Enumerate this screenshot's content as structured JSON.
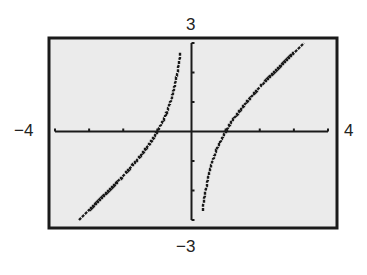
{
  "chart_data": {
    "type": "line",
    "title": "",
    "function": "y = x - 1/x",
    "xlabel": "",
    "ylabel": "",
    "xlim": [
      -4,
      4
    ],
    "ylim": [
      -3,
      3
    ],
    "xscale": 1,
    "yscale": 1,
    "grid": false,
    "legend": null,
    "window_labels": {
      "xmin": "−4",
      "xmax": "4",
      "ymin": "−3",
      "ymax": "3"
    },
    "vertical_asymptote": 0,
    "zeros": [
      -1,
      1
    ],
    "series": [
      {
        "name": "left branch",
        "x": [
          -3.3,
          -3,
          -2.5,
          -2,
          -1.5,
          -1,
          -0.75,
          -0.5,
          -0.4,
          -0.33
        ],
        "y": [
          -3.0,
          -2.67,
          -2.1,
          -1.5,
          -0.83,
          0,
          0.58,
          1.5,
          2.1,
          2.7
        ]
      },
      {
        "name": "right branch",
        "x": [
          0.33,
          0.4,
          0.5,
          0.75,
          1,
          1.5,
          2,
          2.5,
          3,
          3.35
        ],
        "y": [
          -2.7,
          -2.1,
          -1.5,
          -0.58,
          0,
          0.83,
          1.5,
          2.1,
          2.67,
          3.05
        ]
      }
    ]
  },
  "colors": {
    "background": "#ebebeb",
    "frame": "#1a1a1a",
    "plot": "#1a1a1a"
  }
}
